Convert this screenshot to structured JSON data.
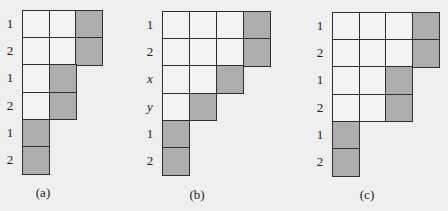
{
  "figure": {
    "colors": {
      "background": "#efefef",
      "empty_cell": "#f3f3f3",
      "shaded_cell": "#adadad",
      "grid_line": "#2f2f2f"
    },
    "panels": [
      {
        "caption": "(a)",
        "rows": [
          {
            "label": "1",
            "italic": false,
            "cells": 3,
            "shaded": [
              2
            ]
          },
          {
            "label": "2",
            "italic": false,
            "cells": 3,
            "shaded": [
              2
            ]
          },
          {
            "label": "1",
            "italic": false,
            "cells": 2,
            "shaded": [
              1
            ]
          },
          {
            "label": "2",
            "italic": false,
            "cells": 2,
            "shaded": [
              1
            ]
          },
          {
            "label": "1",
            "italic": false,
            "cells": 1,
            "shaded": [
              0
            ]
          },
          {
            "label": "2",
            "italic": false,
            "cells": 1,
            "shaded": [
              0
            ]
          }
        ]
      },
      {
        "caption": "(b)",
        "rows": [
          {
            "label": "1",
            "italic": false,
            "cells": 4,
            "shaded": [
              3
            ]
          },
          {
            "label": "2",
            "italic": false,
            "cells": 4,
            "shaded": [
              3
            ]
          },
          {
            "label": "x",
            "italic": true,
            "cells": 3,
            "shaded": [
              2
            ]
          },
          {
            "label": "y",
            "italic": true,
            "cells": 2,
            "shaded": [
              1
            ]
          },
          {
            "label": "1",
            "italic": false,
            "cells": 1,
            "shaded": [
              0
            ]
          },
          {
            "label": "2",
            "italic": false,
            "cells": 1,
            "shaded": [
              0
            ]
          }
        ]
      },
      {
        "caption": "(c)",
        "rows": [
          {
            "label": "1",
            "italic": false,
            "cells": 4,
            "shaded": [
              3
            ]
          },
          {
            "label": "2",
            "italic": false,
            "cells": 4,
            "shaded": [
              3
            ]
          },
          {
            "label": "1",
            "italic": false,
            "cells": 3,
            "shaded": [
              2
            ]
          },
          {
            "label": "2",
            "italic": false,
            "cells": 3,
            "shaded": [
              2
            ]
          },
          {
            "label": "1",
            "italic": false,
            "cells": 1,
            "shaded": [
              0
            ]
          },
          {
            "label": "2",
            "italic": false,
            "cells": 1,
            "shaded": [
              0
            ]
          }
        ]
      }
    ]
  }
}
